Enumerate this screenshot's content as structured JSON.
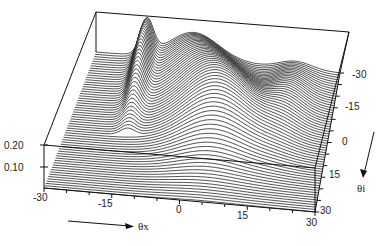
{
  "chart_data": {
    "type": "waterfall-3d",
    "title": "",
    "xlabel": "θx",
    "ylabel": "θi",
    "zlabel": "",
    "x_ticks": [
      -30,
      -15,
      0,
      15,
      30
    ],
    "y_ticks": [
      -30,
      -15,
      0,
      15,
      30
    ],
    "z_ticks": [
      0.1,
      0.2
    ],
    "xlim": [
      -30,
      30
    ],
    "ylim": [
      -30,
      30
    ],
    "zlim": [
      0,
      0.2
    ],
    "n_traces": 60,
    "features": [
      {
        "name": "left ridge",
        "theta_x": -17,
        "theta_i_range": [
          -30,
          0
        ],
        "peak": 0.2
      },
      {
        "name": "main peak",
        "theta_x": -5,
        "theta_i": -25,
        "peak": 0.21
      },
      {
        "name": "central mountain",
        "theta_x": 5,
        "theta_i_range": [
          -15,
          15
        ],
        "peak": 0.16
      },
      {
        "name": "right shoulder",
        "theta_x": 18,
        "theta_i_range": [
          -25,
          5
        ],
        "peak": 0.1
      }
    ]
  },
  "labels": {
    "z_tick_0": "0.20",
    "z_tick_1": "0.10",
    "x_tick_0": "-30",
    "x_tick_1": "-15",
    "x_tick_2": "0",
    "x_tick_3": "15",
    "x_tick_4": "30",
    "y_tick_0": "-30",
    "y_tick_1": "-15",
    "y_tick_2": "0",
    "y_tick_3": "15",
    "y_tick_4": "30",
    "x_axis_name": "θx",
    "y_axis_name": "θi"
  }
}
